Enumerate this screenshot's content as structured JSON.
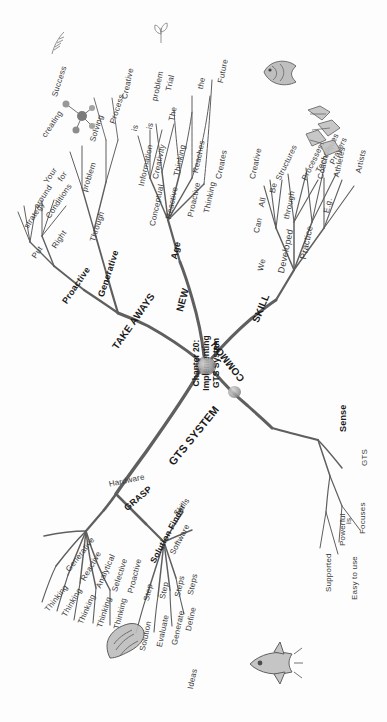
{
  "diagram": {
    "type": "mind-map",
    "orientation": "rotated-90-clockwise",
    "center": {
      "title": "Chapter 20:\nImplementing\nGTS System"
    },
    "branches": [
      {
        "id": "takeaways",
        "label": "TAKE AWAYS",
        "children": [
          {
            "label": "Proactive",
            "children": [
              {
                "label": "Put",
                "children": [
                  {
                    "label": "strategy"
                  },
                  {
                    "label": "around"
                  },
                  {
                    "label": "Your"
                  }
                ]
              },
              {
                "label": "Right",
                "children": [
                  {
                    "label": "Conditions"
                  },
                  {
                    "label": "for"
                  },
                  {
                    "label": "creating"
                  }
                ]
              }
            ]
          },
          {
            "label": "Generative",
            "children": [
              {
                "label": "Through",
                "children": [
                  {
                    "label": "problem"
                  },
                  {
                    "label": "Solving"
                  }
                ]
              },
              {
                "label": "Process",
                "children": [
                  {
                    "label": "Success"
                  }
                ]
              }
            ]
          }
        ]
      },
      {
        "id": "new",
        "label": "NEW",
        "children": [
          {
            "label": "Age",
            "children": [
              {
                "label": "Conceptual",
                "children": [
                  {
                    "label": "Information"
                  },
                  {
                    "label": "is"
                  },
                  {
                    "label": "Creative"
                  }
                ]
              },
              {
                "label": "Reactive",
                "children": [
                  {
                    "label": "Creativity"
                  },
                  {
                    "label": "is"
                  },
                  {
                    "label": "problem"
                  }
                ]
              },
              {
                "label": "Proactive",
                "children": [
                  {
                    "label": "Thinking"
                  },
                  {
                    "label": "The"
                  },
                  {
                    "label": "Trial"
                  }
                ]
              },
              {
                "label": "Thinking",
                "children": [
                  {
                    "label": "Reaches"
                  },
                  {
                    "label": "the"
                  }
                ]
              },
              {
                "label": "Creates",
                "children": [
                  {
                    "label": "Future"
                  }
                ]
              }
            ]
          }
        ]
      },
      {
        "id": "skill",
        "label": "SKILL",
        "children": [
          {
            "label": "We",
            "children": [
              {
                "label": "Can"
              },
              {
                "label": "All"
              },
              {
                "label": "Be"
              }
            ]
          },
          {
            "label": "Developed",
            "children": [
              {
                "label": "through"
              },
              {
                "label": "Creative"
              },
              {
                "label": "Structures"
              }
            ]
          },
          {
            "label": "Practice",
            "children": [
              {
                "label": "Processes"
              },
              {
                "label": "Techniques"
              },
              {
                "label": "Prayers"
              }
            ]
          },
          {
            "label": "E.g.",
            "children": [
              {
                "label": "Coaches"
              },
              {
                "label": "Athletes"
              },
              {
                "label": "Artists"
              }
            ]
          }
        ]
      },
      {
        "id": "common",
        "label": "COMMON",
        "children": [
          {
            "label": "Sense",
            "children": [
              {
                "label": "GTS",
                "children": [
                  {
                    "label": "Focuses"
                  },
                  {
                    "label": "is"
                  }
                ]
              },
              {
                "label": "Powerful",
                "children": [
                  {
                    "label": "Supported"
                  },
                  {
                    "label": "Easy to use"
                  }
                ]
              }
            ]
          }
        ]
      },
      {
        "id": "gts-system",
        "label": "GTS SYSTEM",
        "children": [
          {
            "label": "GRASP",
            "children": [
              {
                "label": "Hardware"
              },
              {
                "label": "Generative",
                "children": [
                  {
                    "label": "Thinking"
                  }
                ]
              },
              {
                "label": "Reactive",
                "children": [
                  {
                    "label": "Thinking"
                  }
                ]
              },
              {
                "label": "Analytical",
                "children": [
                  {
                    "label": "Thinking"
                  }
                ]
              },
              {
                "label": "Selective",
                "children": [
                  {
                    "label": "Thinking"
                  }
                ]
              },
              {
                "label": "Proactive",
                "children": [
                  {
                    "label": "Thinking"
                  }
                ]
              }
            ]
          },
          {
            "label": "Solution Finder",
            "children": [
              {
                "label": "Skills"
              },
              {
                "label": "Software"
              },
              {
                "label": "Steps",
                "children": [
                  {
                    "label": "Define"
                  },
                  {
                    "label": "Ideas"
                  }
                ]
              },
              {
                "label": "Steps",
                "children": [
                  {
                    "label": "Generate"
                  }
                ]
              },
              {
                "label": "Step",
                "children": [
                  {
                    "label": "Evaluate"
                  }
                ]
              },
              {
                "label": "Step",
                "children": [
                  {
                    "label": "Solution"
                  }
                ]
              }
            ]
          }
        ]
      }
    ],
    "doodles": [
      {
        "name": "molecule-sketch"
      },
      {
        "name": "fish-sketch"
      },
      {
        "name": "feather-sketch"
      },
      {
        "name": "plant-sketch"
      },
      {
        "name": "gear-cluster-sketch"
      },
      {
        "name": "hand-sketch"
      },
      {
        "name": "rocket-sketch"
      },
      {
        "name": "center-node-blob"
      }
    ],
    "colors": {
      "line": "#5a5a5a",
      "text": "#3a3a3a",
      "title": "#1a1a1a",
      "background": "#fdfdfd"
    }
  }
}
